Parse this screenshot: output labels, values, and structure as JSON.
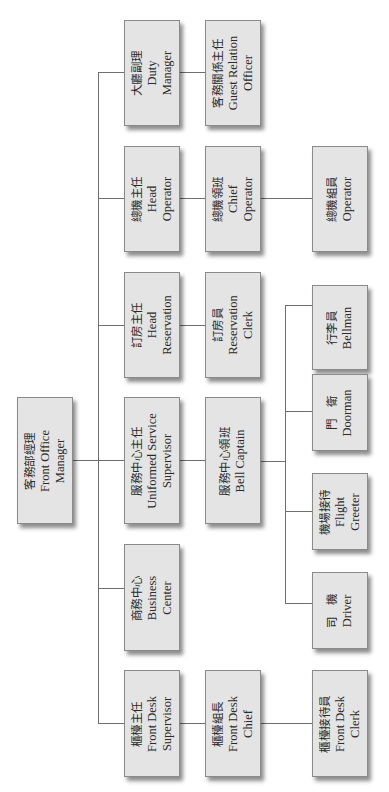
{
  "chart": {
    "orientation": "rotated-90-ccw",
    "nodes": {
      "front_office_manager": {
        "zh": "客務部經理",
        "en1": "Front Office",
        "en2": "Manager"
      },
      "duty_manager": {
        "zh": "大廳副理",
        "en1": "Duty",
        "en2": "Manager"
      },
      "guest_relation_officer": {
        "zh": "客務關係主任",
        "en1": "Guest Relation",
        "en2": "Officer"
      },
      "head_operator": {
        "zh": "總機主任",
        "en1": "Head",
        "en2": "Operator"
      },
      "chief_operator": {
        "zh": "總機領班",
        "en1": "Chief",
        "en2": "Operator"
      },
      "operator": {
        "zh": "總機組員",
        "en1": "Operator",
        "en2": ""
      },
      "head_reservation": {
        "zh": "訂房主任",
        "en1": "Head",
        "en2": "Reservation"
      },
      "reservation_clerk": {
        "zh": "訂房員",
        "en1": "Reservation",
        "en2": "Clerk"
      },
      "uniformed_service_supervisor": {
        "zh": "服務中心主任",
        "en1": "Uniformed Service",
        "en2": "Supervisor"
      },
      "bell_captain": {
        "zh": "服務中心領班",
        "en1": "Bell Captain",
        "en2": ""
      },
      "bellman": {
        "zh": "行李員",
        "en1": "Bellman",
        "en2": ""
      },
      "doorman": {
        "zh": "門　衛",
        "en1": "Doorman",
        "en2": ""
      },
      "flight_greeter": {
        "zh": "機場接待",
        "en1": "Flight",
        "en2": "Greeter"
      },
      "driver": {
        "zh": "司　機",
        "en1": "Driver",
        "en2": ""
      },
      "business_center": {
        "zh": "商務中心",
        "en1": "Business",
        "en2": "Center"
      },
      "front_desk_supervisor": {
        "zh": "櫃檯主任",
        "en1": "Front Desk",
        "en2": "Supervisor"
      },
      "front_desk_chief": {
        "zh": "櫃檯組長",
        "en1": "Front Desk",
        "en2": "Chief"
      },
      "front_desk_clerk": {
        "zh": "櫃檯接待員",
        "en1": "Front Desk",
        "en2": "Clerk"
      }
    },
    "edges": [
      [
        "front_office_manager",
        "duty_manager"
      ],
      [
        "front_office_manager",
        "head_operator"
      ],
      [
        "front_office_manager",
        "head_reservation"
      ],
      [
        "front_office_manager",
        "uniformed_service_supervisor"
      ],
      [
        "front_office_manager",
        "business_center"
      ],
      [
        "front_office_manager",
        "front_desk_supervisor"
      ],
      [
        "duty_manager",
        "guest_relation_officer"
      ],
      [
        "head_operator",
        "chief_operator"
      ],
      [
        "chief_operator",
        "operator"
      ],
      [
        "head_reservation",
        "reservation_clerk"
      ],
      [
        "uniformed_service_supervisor",
        "bell_captain"
      ],
      [
        "bell_captain",
        "bellman"
      ],
      [
        "bell_captain",
        "doorman"
      ],
      [
        "bell_captain",
        "flight_greeter"
      ],
      [
        "bell_captain",
        "driver"
      ],
      [
        "front_desk_supervisor",
        "front_desk_chief"
      ],
      [
        "front_desk_chief",
        "front_desk_clerk"
      ]
    ]
  }
}
